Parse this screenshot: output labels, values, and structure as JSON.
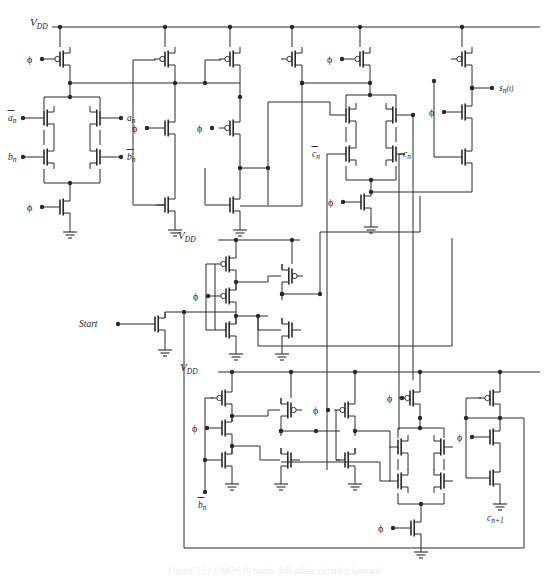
{
  "figure": {
    "domain": "Diagram",
    "kind": "circuit-schematic",
    "caption": "Figure  3.21  CMOS  dynamic  full  adder  circuit  schematic",
    "caption_visible": "clipped-at-bottom-edge",
    "background": "#ffffff",
    "ink": "#2a2a2a"
  },
  "power_rails": [
    {
      "id": "vdd-top",
      "label": "V",
      "subscript": "DD",
      "x": 28,
      "y": 27,
      "x2": 540,
      "taps": 6
    },
    {
      "id": "vdd-middle",
      "label": "V",
      "subscript": "DD",
      "x": 176,
      "y": 240,
      "x2": 300,
      "taps": 2
    },
    {
      "id": "vdd-bottom",
      "label": "V",
      "subscript": "DD",
      "x": 176,
      "y": 372,
      "x2": 540,
      "taps": 5
    }
  ],
  "signals": {
    "clock": "ϕ",
    "inputs": [
      "ān",
      "an",
      "bn",
      "b̄n",
      "c̄n",
      "cn",
      "Start"
    ],
    "outputs": [
      "sn(t)",
      "cn+1"
    ]
  },
  "labels": {
    "vdd": "V",
    "vdd_sub": "DD",
    "phi": "ϕ",
    "a_bar": "a",
    "a": "a",
    "b": "b",
    "b_bar": "b",
    "c_bar": "c",
    "c": "c",
    "sub_n": "n",
    "start": "Start",
    "sum_out": "s",
    "sum_out_sub": "n",
    "sum_out_arg": "(t)",
    "carry_out": "c",
    "carry_out_sub": "n+1"
  },
  "blocks": [
    {
      "id": "xor-bridge-ab",
      "name": "ab-transmission-bridge",
      "role": "sum generate network",
      "inputs_left": [
        "ān",
        "bn"
      ],
      "inputs_right": [
        "an",
        "b̄n"
      ],
      "precharge": "ϕ PMOS",
      "footer": "ϕ NMOS"
    },
    {
      "id": "xor-bridge-c",
      "name": "carry-transmission-bridge",
      "role": "carry propagate network",
      "inputs_left": [
        "c̄n"
      ],
      "inputs_right": [
        "cn"
      ],
      "precharge": "ϕ PMOS",
      "footer": "ϕ NMOS"
    },
    {
      "id": "xor-bridge-bottom",
      "name": "carry-out-bridge",
      "role": "carry out generate network",
      "footer": "ϕ NMOS"
    },
    {
      "id": "start-device",
      "name": "start-nmos",
      "role": "initialisation pull-down",
      "gate": "Start"
    },
    {
      "id": "latch-middle",
      "name": "middle-latch",
      "role": "clocked keeper latch"
    },
    {
      "id": "out-buffer-sum",
      "name": "sum-output-buffer",
      "role": "clocked output inverter chain",
      "output": "sn(t)"
    },
    {
      "id": "out-buffer-carry",
      "name": "carry-output-buffer",
      "role": "clocked output inverter chain",
      "output": "cn+1"
    }
  ],
  "counts": {
    "pmos_top_rail": 6,
    "pmos_middle_rail": 2,
    "pmos_bottom_rail": 5,
    "transmission_bridges": 3,
    "ground_symbols": 13
  }
}
